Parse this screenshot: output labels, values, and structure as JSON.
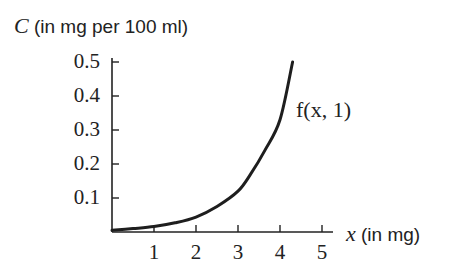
{
  "chart_data": {
    "type": "line",
    "title": "",
    "xlabel": "x (in mg)",
    "ylabel": "C (in mg per 100 ml)",
    "xlabel_var": "x",
    "xlabel_unit": "(in mg)",
    "ylabel_var": "C",
    "ylabel_unit": "(in mg per 100 ml)",
    "xlim": [
      0,
      5
    ],
    "ylim": [
      0,
      0.5
    ],
    "x_ticks": [
      "1",
      "2",
      "3",
      "4",
      "5"
    ],
    "y_ticks": [
      "0.1",
      "0.2",
      "0.3",
      "0.4",
      "0.5"
    ],
    "grid": false,
    "legend": "none",
    "series": [
      {
        "name": "f(x, 1)",
        "annotation": "f(x, 1)",
        "x": [
          0,
          0.5,
          1,
          1.5,
          2,
          2.5,
          3,
          3.3,
          3.64,
          4,
          4.3
        ],
        "values": [
          0.005,
          0.01,
          0.016,
          0.027,
          0.044,
          0.075,
          0.12,
          0.17,
          0.24,
          0.33,
          0.5
        ]
      }
    ]
  }
}
